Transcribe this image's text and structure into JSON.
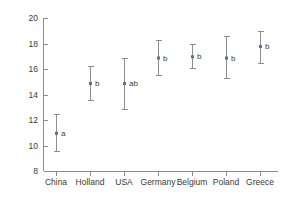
{
  "chart_data": {
    "type": "scatter",
    "title": "",
    "xlabel": "",
    "ylabel": "",
    "ylim": [
      8,
      20
    ],
    "yticks": [
      8,
      10,
      12,
      14,
      16,
      18,
      20
    ],
    "ytick_labels": [
      "8",
      "10",
      "12",
      "14",
      "16",
      "18",
      "20"
    ],
    "grid": false,
    "legend": "none",
    "categories": [
      "China",
      "Holland",
      "USA",
      "Germany",
      "Belgium",
      "Poland",
      "Greece"
    ],
    "values": [
      11.0,
      14.9,
      14.9,
      16.9,
      17.0,
      16.9,
      17.8
    ],
    "error_low": [
      9.6,
      13.6,
      12.9,
      15.5,
      16.1,
      15.3,
      16.5
    ],
    "error_high": [
      12.5,
      16.2,
      16.9,
      18.3,
      18.0,
      18.6,
      19.0
    ],
    "annotations": [
      "a",
      "b",
      "ab",
      "b",
      "b",
      "b",
      "b"
    ],
    "points": [
      {
        "category": "China",
        "value": 11.0,
        "low": 9.6,
        "high": 12.5,
        "letter": "a"
      },
      {
        "category": "Holland",
        "value": 14.9,
        "low": 13.6,
        "high": 16.2,
        "letter": "b"
      },
      {
        "category": "USA",
        "value": 14.9,
        "low": 12.9,
        "high": 16.9,
        "letter": "ab"
      },
      {
        "category": "Germany",
        "value": 16.9,
        "low": 15.5,
        "high": 18.3,
        "letter": "b"
      },
      {
        "category": "Belgium",
        "value": 17.0,
        "low": 16.1,
        "high": 18.0,
        "letter": "b"
      },
      {
        "category": "Poland",
        "value": 16.9,
        "low": 15.3,
        "high": 18.6,
        "letter": "b"
      },
      {
        "category": "Greece",
        "value": 17.8,
        "low": 16.5,
        "high": 19.0,
        "letter": "b"
      }
    ],
    "colors": {
      "axis": "#8c8c8c",
      "errorbar": "#8e8e8e",
      "marker": "#6e6e6e",
      "text": "#3a3a3a",
      "background": "#ffffff"
    }
  }
}
